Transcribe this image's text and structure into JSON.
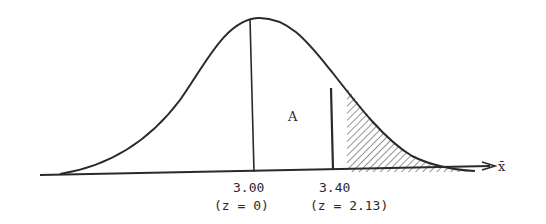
{
  "diagram": {
    "type": "normal-distribution-curve",
    "axis_label": "x̄",
    "region_label": "A",
    "shaded_region": "right tail beyond 3.40",
    "markers": [
      {
        "value": "3.00",
        "z_label": "(z = 0)"
      },
      {
        "value": "3.40",
        "z_label": "(z = 2.13)"
      }
    ],
    "colors": {
      "ink": "#2a2a2a",
      "background": "#ffffff"
    }
  }
}
